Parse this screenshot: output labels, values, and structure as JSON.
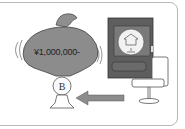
{
  "illustration": {
    "money_bag": {
      "amount_label": "¥1,000,000-",
      "color": "#8a8a8a"
    },
    "coin": {
      "symbol": "B"
    },
    "arrow": {
      "direction": "left",
      "color": "#8c8c8c"
    },
    "device": {
      "type": "hard-drive",
      "color": "#5a5a5a"
    }
  }
}
